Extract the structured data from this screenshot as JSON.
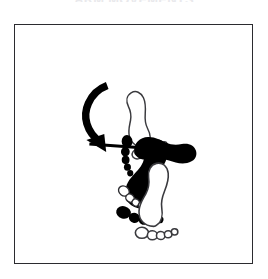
{
  "figure": {
    "title": "ARM MOVEMENTS",
    "title_clipped": true,
    "panel": {
      "background_color": "#ffffff",
      "border_color": "#2b2b2f",
      "bounds": {
        "x": 14,
        "y": 24,
        "width": 239,
        "height": 240
      }
    },
    "colors": {
      "ink": "#000000",
      "outline_stroke": "#3a3a3e",
      "outline_fill": "#ffffff",
      "frame": "#2b2b2f",
      "page": "#ffffff"
    },
    "groups": [
      {
        "id": "rotation-group",
        "name": "foot-rotation-diagram",
        "description": "Outlined footprint rotating into a filled footprint, indicated by a curved arrow",
        "elements": [
          {
            "id": "top-outline-foot",
            "name": "outlined-footprint",
            "style": "outline",
            "orientation_deg": -18,
            "toes": 5
          },
          {
            "id": "top-solid-foot",
            "name": "filled-footprint",
            "style": "solid",
            "orientation_deg": 14,
            "toes": 5
          },
          {
            "id": "curved-arrow",
            "name": "curved-rotation-arrow",
            "style": "solid",
            "direction": "counter-clockwise",
            "head": "down-left"
          }
        ]
      },
      {
        "id": "translation-group",
        "name": "foot-translation-diagram",
        "description": "Outlined footprint translating to a filled footprint, indicated by a straight arrow",
        "elements": [
          {
            "id": "bottom-outline-foot",
            "name": "outlined-footprint",
            "style": "outline",
            "orientation_deg": 0,
            "toes": 5
          },
          {
            "id": "straight-arrow",
            "name": "straight-translation-arrow",
            "style": "solid",
            "direction": "right",
            "head": "right"
          },
          {
            "id": "bottom-solid-foot",
            "name": "filled-footprint",
            "style": "solid",
            "orientation_deg": 90,
            "toes": 5
          }
        ]
      }
    ]
  }
}
